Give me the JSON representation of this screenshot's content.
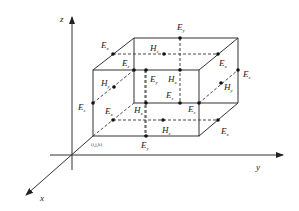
{
  "diagram": {
    "axes": {
      "z_label": "z",
      "y_label": "y",
      "x_label": "x"
    },
    "origin_label": "(i,j,k)",
    "field_labels": [
      {
        "id": "Ey_top_back",
        "main": "E",
        "sub": "y"
      },
      {
        "id": "Ex_top_left",
        "main": "E",
        "sub": "x"
      },
      {
        "id": "Hz_top",
        "main": "H",
        "sub": "z"
      },
      {
        "id": "Ez_front_top",
        "main": "E",
        "sub": "z"
      },
      {
        "id": "Ex_top_right",
        "main": "E",
        "sub": "x"
      },
      {
        "id": "Ez_back_right",
        "main": "E",
        "sub": "z"
      },
      {
        "id": "Hy_left",
        "main": "H",
        "sub": "y"
      },
      {
        "id": "Ey_front_mid",
        "main": "E",
        "sub": "y"
      },
      {
        "id": "Hx_mid",
        "main": "H",
        "sub": "x"
      },
      {
        "id": "Hy_right",
        "main": "H",
        "sub": "y"
      },
      {
        "id": "Ez_left",
        "main": "E",
        "sub": "z"
      },
      {
        "id": "Ez_center",
        "main": "E",
        "sub": "z"
      },
      {
        "id": "Ez_front_right",
        "main": "E",
        "sub": "z"
      },
      {
        "id": "Ex_bottom_left",
        "main": "E",
        "sub": "x"
      },
      {
        "id": "Hx_bottom",
        "main": "H",
        "sub": "x"
      },
      {
        "id": "Hz_bottom",
        "main": "H",
        "sub": "z"
      },
      {
        "id": "Ex_bottom_right",
        "main": "E",
        "sub": "x"
      },
      {
        "id": "Ey_bottom",
        "main": "E",
        "sub": "y"
      }
    ]
  }
}
